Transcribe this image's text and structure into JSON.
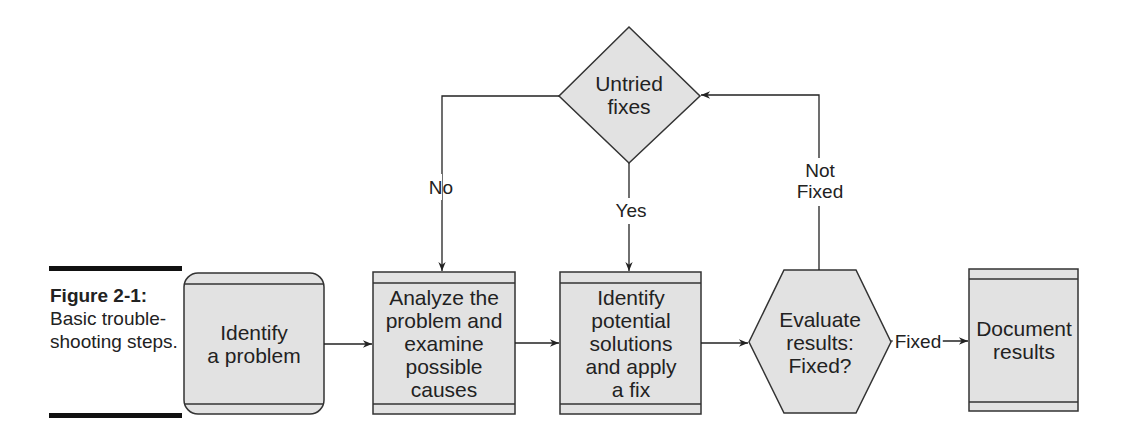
{
  "caption": {
    "figure_label": "Figure 2-1:",
    "text": "Basic trouble-shooting steps."
  },
  "nodes": {
    "identify_problem": {
      "label": "Identify\na problem",
      "shape": "rounded-rect"
    },
    "analyze": {
      "label": "Analyze the\nproblem and\nexamine\npossible\ncauses",
      "shape": "rect"
    },
    "identify_solutions": {
      "label": "Identify\npotential\nsolutions\nand apply\na fix",
      "shape": "rect"
    },
    "evaluate": {
      "label": "Evaluate\nresults:\nFixed?",
      "shape": "hexagon"
    },
    "document": {
      "label": "Document\nresults",
      "shape": "rect"
    },
    "untried_fixes": {
      "label": "Untried\nfixes",
      "shape": "diamond"
    }
  },
  "edges": {
    "no": "No",
    "yes": "Yes",
    "not_fixed": "Not\nFixed",
    "fixed": "Fixed"
  },
  "colors": {
    "node_fill": "#e2e2e2",
    "stroke": "#333333",
    "rule": "#111111"
  }
}
